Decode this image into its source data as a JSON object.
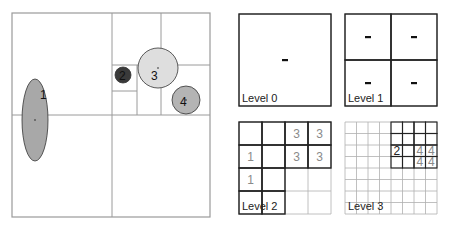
{
  "spatial_view": {
    "frame": {
      "x": 12,
      "y": 13,
      "w": 198,
      "h": 204,
      "stroke": "#9a9a9a"
    },
    "lines": [
      {
        "x1": 112,
        "y1": 13,
        "x2": 112,
        "y2": 217
      },
      {
        "x1": 12,
        "y1": 115,
        "x2": 210,
        "y2": 115
      },
      {
        "x1": 161,
        "y1": 13,
        "x2": 161,
        "y2": 115
      },
      {
        "x1": 112,
        "y1": 65,
        "x2": 210,
        "y2": 65
      },
      {
        "x1": 137,
        "y1": 65,
        "x2": 137,
        "y2": 115
      },
      {
        "x1": 112,
        "y1": 91,
        "x2": 137,
        "y2": 91
      }
    ],
    "objects": [
      {
        "id": "1",
        "label": "1",
        "shape": "ellipse",
        "cx": 35,
        "cy": 120,
        "rx": 13,
        "ry": 41,
        "fill": "#a8a8a8",
        "label_x": 40,
        "label_y": 99
      },
      {
        "id": "2",
        "label": "2",
        "shape": "circle",
        "cx": 123,
        "cy": 75,
        "r": 8,
        "fill": "#3a3a3a",
        "label_x": 119,
        "label_y": 80
      },
      {
        "id": "3",
        "label": "3",
        "shape": "circle",
        "cx": 158,
        "cy": 68,
        "r": 20,
        "fill": "#dedede",
        "label_x": 151,
        "label_y": 80
      },
      {
        "id": "4",
        "label": "4",
        "shape": "circle",
        "cx": 186,
        "cy": 100,
        "r": 14,
        "fill": "#b4b4b4",
        "label_x": 180,
        "label_y": 106
      }
    ]
  },
  "levels": [
    {
      "name": "Level 0",
      "x": 239,
      "y": 14,
      "size": 92,
      "grid": 1,
      "cells": [
        {
          "r": 0,
          "c": 0,
          "dark": true,
          "value": "-"
        }
      ]
    },
    {
      "name": "Level 1",
      "x": 345,
      "y": 14,
      "size": 92,
      "grid": 2,
      "cells": [
        {
          "r": 0,
          "c": 0,
          "dark": true,
          "value": "-"
        },
        {
          "r": 0,
          "c": 1,
          "dark": true,
          "value": "-"
        },
        {
          "r": 1,
          "c": 0,
          "dark": true,
          "value": "-"
        },
        {
          "r": 1,
          "c": 1,
          "dark": true,
          "value": "-"
        }
      ]
    },
    {
      "name": "Level 2",
      "x": 239,
      "y": 122,
      "size": 92,
      "grid": 4,
      "cells": [
        {
          "r": 0,
          "c": 0,
          "dark": true,
          "value": ""
        },
        {
          "r": 0,
          "c": 1,
          "dark": true,
          "value": ""
        },
        {
          "r": 0,
          "c": 2,
          "dark": true,
          "value": "3"
        },
        {
          "r": 0,
          "c": 3,
          "dark": true,
          "value": "3"
        },
        {
          "r": 1,
          "c": 0,
          "dark": true,
          "value": "1"
        },
        {
          "r": 1,
          "c": 1,
          "dark": true,
          "value": ""
        },
        {
          "r": 1,
          "c": 2,
          "dark": true,
          "value": "3"
        },
        {
          "r": 1,
          "c": 3,
          "dark": true,
          "value": "3"
        },
        {
          "r": 2,
          "c": 0,
          "dark": true,
          "value": "1"
        },
        {
          "r": 2,
          "c": 1,
          "dark": true,
          "value": ""
        },
        {
          "r": 3,
          "c": 0,
          "dark": true,
          "value": ""
        },
        {
          "r": 3,
          "c": 1,
          "dark": true,
          "value": ""
        }
      ]
    },
    {
      "name": "Level 3",
      "x": 345,
      "y": 122,
      "size": 92,
      "grid": 8,
      "cells": [
        {
          "r": 0,
          "c": 4,
          "dark": true,
          "value": ""
        },
        {
          "r": 0,
          "c": 5,
          "dark": true,
          "value": ""
        },
        {
          "r": 0,
          "c": 6,
          "dark": true,
          "value": ""
        },
        {
          "r": 0,
          "c": 7,
          "dark": true,
          "value": ""
        },
        {
          "r": 1,
          "c": 4,
          "dark": true,
          "value": ""
        },
        {
          "r": 1,
          "c": 5,
          "dark": true,
          "value": ""
        },
        {
          "r": 1,
          "c": 6,
          "dark": true,
          "value": ""
        },
        {
          "r": 1,
          "c": 7,
          "dark": true,
          "value": ""
        },
        {
          "r": 2,
          "c": 4,
          "dark": true,
          "value": "2",
          "strong": true
        },
        {
          "r": 2,
          "c": 5,
          "dark": true,
          "value": ""
        },
        {
          "r": 2,
          "c": 6,
          "dark": true,
          "value": "4"
        },
        {
          "r": 2,
          "c": 7,
          "dark": true,
          "value": "4"
        },
        {
          "r": 3,
          "c": 4,
          "dark": true,
          "value": ""
        },
        {
          "r": 3,
          "c": 5,
          "dark": true,
          "value": ""
        },
        {
          "r": 3,
          "c": 6,
          "dark": true,
          "value": "4"
        },
        {
          "r": 3,
          "c": 7,
          "dark": true,
          "value": "4"
        }
      ]
    }
  ],
  "colors": {
    "light_grid": "#b0b0b0",
    "dark_grid": "#222222",
    "value_text": "#8a8a8a",
    "strong_text": "#222222",
    "dash": "#111111"
  }
}
